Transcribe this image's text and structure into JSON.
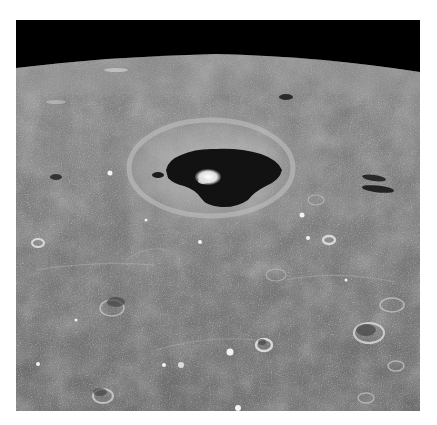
{
  "image": {
    "subject": "Lunar surface photograph",
    "description": "Oblique grayscale view of the Moon's surface with a curved horizon against a black sky, a large crater with a dark flooded floor and a bright central peak, surrounded by a lighter ejecta halo and many smaller craters",
    "colors": {
      "sky": "#000000",
      "surface": "#7a7a7a",
      "surface_dark": "#5c5c5c",
      "surface_light": "#a8a8a8",
      "crater_floor": "#111111",
      "central_peak": "#e6e6e6",
      "background": "#ffffff"
    }
  }
}
